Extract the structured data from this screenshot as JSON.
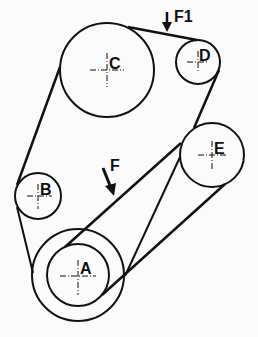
{
  "diagram": {
    "type": "belt-drive-pulley-system",
    "colors": {
      "line": "#111111",
      "background": "#fbfbfb"
    },
    "pulleys": [
      {
        "id": "A",
        "label": "A",
        "cx": 78,
        "cy": 275,
        "r_outer": 46,
        "r_inner": 31
      },
      {
        "id": "B",
        "label": "B",
        "cx": 38,
        "cy": 196,
        "r": 23
      },
      {
        "id": "C",
        "label": "C",
        "cx": 107,
        "cy": 70,
        "r": 47
      },
      {
        "id": "D",
        "label": "D",
        "cx": 198,
        "cy": 62,
        "r": 22
      },
      {
        "id": "E",
        "label": "E",
        "cx": 212,
        "cy": 155,
        "r": 32
      }
    ],
    "forces": [
      {
        "id": "F1",
        "label": "F1"
      },
      {
        "id": "F",
        "label": "F"
      }
    ]
  }
}
